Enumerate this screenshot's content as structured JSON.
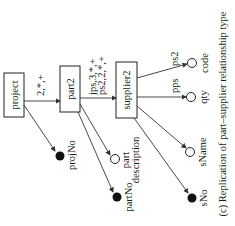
{
  "diagram": {
    "nodes": {
      "project": "project",
      "part": "part2",
      "supplier": "supplier2"
    },
    "edges": {
      "project_part": "2,*,+",
      "part_supplier_1": "jps,3,*,+",
      "part_supplier_2": "ps2,2,*,+",
      "supplier_code": "ps2",
      "supplier_qty": "pps"
    },
    "attributes": {
      "projNo": "projNo",
      "partNo": "partNo",
      "part_description_1": "part",
      "part_description_2": "description",
      "sNo": "sNo",
      "sName": "sName",
      "qty": "qty",
      "code": "code"
    },
    "caption": "(c) Replication of part–supplier relationship type"
  }
}
